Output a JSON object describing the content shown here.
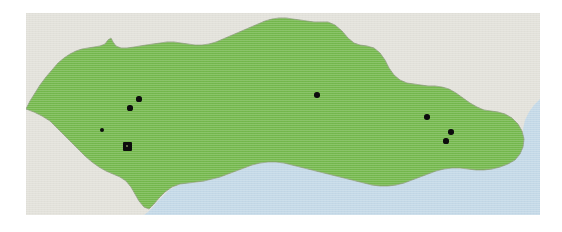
{
  "figure": {
    "type": "distribution-map",
    "width": 562,
    "height": 232,
    "background_color": "#ffffff"
  },
  "map": {
    "panel": {
      "x": 26,
      "y": 13,
      "width": 514,
      "height": 202
    },
    "layers": {
      "highlight_region_label": "highlighted region",
      "highlight_region_color": "#74b84c",
      "surrounding_land_label": "surrounding land",
      "surrounding_land_color": "#e2e1da",
      "sea_label": "sea",
      "sea_color": "#c3d8e7",
      "coastline_color": "#8a9a7a",
      "marker_color": "#0d0d0d"
    },
    "land_path": "M 0,96 L 4,88 L 9,80 L 14,72 L 20,64 L 26,57 L 32,50 L 38,45 L 44,41 L 50,38 L 56,36 L 62,35 L 68,34 L 74,33 L 79,31 L 82,27 L 85,25 L 87,29 L 90,33 L 95,35 L 101,35 L 108,34 L 114,33 L 120,32 L 127,31 L 134,30 L 141,29 L 148,29 L 155,30 L 162,31 L 169,32 L 176,32 L 183,31 L 190,29 L 197,26 L 204,23 L 211,20 L 218,17 L 225,14 L 232,11 L 239,8 L 246,6 L 253,5 L 260,5 L 267,6 L 274,7 L 281,8 L 288,9 L 295,9 L 302,9 L 309,12 L 316,18 L 322,25 L 328,30 L 334,32 L 341,33 L 348,35 L 354,40 L 359,47 L 363,55 L 368,62 L 374,67 L 381,70 L 388,71 L 395,72 L 402,73 L 409,73 L 416,74 L 423,76 L 430,80 L 437,85 L 444,90 L 451,94 L 458,97 L 465,98 L 472,99 L 479,101 L 486,105 L 492,111 L 496,118 L 498,126 L 497,134 L 494,141 L 489,147 L 482,151 L 474,154 L 466,156 L 458,157 L 450,157 L 442,156 L 434,155 L 426,155 L 418,156 L 410,158 L 402,161 L 394,164 L 386,167 L 378,170 L 370,172 L 362,173 L 354,173 L 346,172 L 338,170 L 330,168 L 322,166 L 314,164 L 306,162 L 298,160 L 290,158 L 282,156 L 274,154 L 266,152 L 258,150 L 250,149 L 242,149 L 234,150 L 226,152 L 218,155 L 210,158 L 202,161 L 194,164 L 186,166 L 178,168 L 170,169 L 162,170 L 154,171 L 146,174 L 139,179 L 133,185 L 128,191 L 123,196 L 118,194 L 113,188 L 109,181 L 105,174 L 100,168 L 94,164 L 87,161 L 80,158 L 73,154 L 66,149 L 59,143 L 52,136 L 45,129 L 38,122 L 31,115 L 24,108 L 16,103 L 8,99 Z",
    "sea_path": "M 0,202 L 514,202 L 514,86 L 508,92 L 503,99 L 499,107 L 497,116 L 497,125 L 495,134 L 491,142 L 485,148 L 478,152 L 470,155 L 462,157 L 454,157 L 446,157 L 438,156 L 430,155 L 422,155 L 414,157 L 406,159 L 398,162 L 390,165 L 382,168 L 374,171 L 366,173 L 358,173 L 350,173 L 342,171 L 334,169 L 326,167 L 318,165 L 310,163 L 302,161 L 294,159 L 286,157 L 278,155 L 270,153 L 262,151 L 254,149 L 246,149 L 238,149 L 230,151 L 222,154 L 214,157 L 206,160 L 198,163 L 190,165 L 182,167 L 174,169 L 166,170 L 158,170 L 150,173 L 143,177 L 137,183 L 131,189 L 126,195 L 122,199 L 118,202 Z",
    "markers": [
      {
        "id": "dot-1",
        "cx": 113,
        "cy": 86,
        "r": 2.6,
        "type": "single"
      },
      {
        "id": "dot-2",
        "cx": 104,
        "cy": 95,
        "r": 2.6,
        "type": "single"
      },
      {
        "id": "dot-3",
        "cx": 76,
        "cy": 117,
        "r": 2.4,
        "type": "single"
      },
      {
        "id": "dot-4",
        "cx": 291,
        "cy": 82,
        "r": 2.8,
        "type": "single"
      },
      {
        "id": "dot-5",
        "cx": 401,
        "cy": 104,
        "r": 2.8,
        "type": "single"
      },
      {
        "id": "dot-6",
        "cx": 425,
        "cy": 119,
        "r": 2.8,
        "type": "single"
      },
      {
        "id": "dot-7",
        "cx": 420,
        "cy": 128,
        "r": 2.6,
        "type": "single"
      },
      {
        "id": "cluster-1",
        "cx": 101,
        "cy": 133,
        "size": 9,
        "type": "cluster"
      }
    ],
    "marker_count_visible": 8
  }
}
